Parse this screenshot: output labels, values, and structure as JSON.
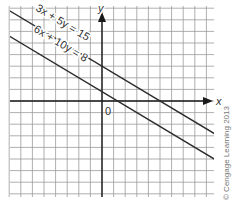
{
  "chart_data": {
    "type": "line",
    "title": "",
    "xlabel": "x",
    "ylabel": "y",
    "origin_label": "0",
    "xlim": [
      -8,
      10
    ],
    "ylim": [
      -8,
      8
    ],
    "grid": true,
    "series": [
      {
        "name": "3x + 5y = 15",
        "equation": "3x + 5y = 15",
        "slope": -0.6,
        "y_intercept": 3,
        "x_intercept": 5
      },
      {
        "name": "6x + 10y = 8",
        "equation": "6x + 10y = 8",
        "slope": -0.6,
        "y_intercept": 0.8,
        "x_intercept": 1.333
      }
    ],
    "annotations": [
      "3x + 5y = 15",
      "6x + 10y = 8"
    ]
  },
  "labels": {
    "line1": "3x + 5y = 15",
    "line2": "6x + 10y = 8",
    "x_axis": "x",
    "y_axis": "y",
    "origin": "0",
    "copyright": "© Cengage Learning 2013"
  },
  "colors": {
    "grid": "#9a9a9a",
    "axis": "#1a1a1a",
    "line": "#2a2a2a",
    "text": "#333333"
  }
}
